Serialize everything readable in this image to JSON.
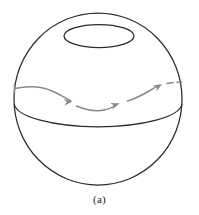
{
  "figure": {
    "caption": "(a)",
    "kind": "sphere-with-parallel-transport-path",
    "colors": {
      "outline": "#2b2b2b",
      "arrow": "#8a8a8a",
      "background": "#ffffff",
      "caption": "#1a1a1a"
    },
    "sphere": {
      "label": "sphere-outline",
      "center_x": 98,
      "center_y": 99,
      "radius_x": 84,
      "radius_y": 86
    },
    "small_circle": {
      "label": "upper-latitude-circle",
      "center_x": 99,
      "center_y": 36,
      "radius_x": 35,
      "radius_y": 12
    },
    "equator": {
      "label": "equator-ellipse",
      "center_x": 98,
      "center_y": 104,
      "radius_x": 84,
      "radius_y": 24
    },
    "path": {
      "label": "transport-path",
      "arrowhead_count": 3,
      "dashed_tail": true,
      "stroke_width": 1.4
    }
  }
}
